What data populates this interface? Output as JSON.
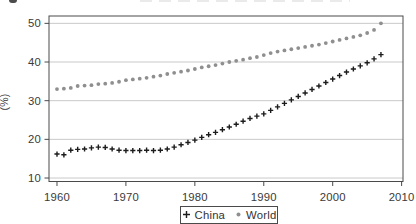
{
  "chart_data": {
    "type": "scatter",
    "title": "",
    "xlabel": "",
    "ylabel": "(%)",
    "x_ticks": [
      1960,
      1970,
      1980,
      1990,
      2000,
      2010
    ],
    "y_ticks": [
      10,
      20,
      30,
      40,
      50
    ],
    "xlim": [
      1958.84,
      2010.2
    ],
    "ylim": [
      9.1,
      51.9
    ],
    "grid": "horizontal-only",
    "gridline_color": "#c9c9c9",
    "frame_color": "#4a4a4a",
    "legend_position": "bottom-center",
    "x": [
      1960,
      1961,
      1962,
      1963,
      1964,
      1965,
      1966,
      1967,
      1968,
      1969,
      1970,
      1971,
      1972,
      1973,
      1974,
      1975,
      1976,
      1977,
      1978,
      1979,
      1980,
      1981,
      1982,
      1983,
      1984,
      1985,
      1986,
      1987,
      1988,
      1989,
      1990,
      1991,
      1992,
      1993,
      1994,
      1995,
      1996,
      1997,
      1998,
      1999,
      2000,
      2001,
      2002,
      2003,
      2004,
      2005,
      2006,
      2007
    ],
    "series": [
      {
        "name": "China",
        "marker": "plus",
        "color": "#1c1c1c",
        "values": [
          16.2,
          16.0,
          17.2,
          17.4,
          17.5,
          17.8,
          18.0,
          17.9,
          17.5,
          17.2,
          17.1,
          17.1,
          17.1,
          17.2,
          17.1,
          17.2,
          17.5,
          18.0,
          18.6,
          19.2,
          19.8,
          20.5,
          21.2,
          21.8,
          22.5,
          23.2,
          23.9,
          24.7,
          25.4,
          26.0,
          26.6,
          27.5,
          28.4,
          29.3,
          30.2,
          31.1,
          32.0,
          32.9,
          33.8,
          34.7,
          35.6,
          36.5,
          37.4,
          38.2,
          39.0,
          39.8,
          40.8,
          41.9
        ]
      },
      {
        "name": "World",
        "marker": "dot",
        "color": "#8f8f8f",
        "values": [
          33.0,
          33.1,
          33.3,
          33.8,
          33.9,
          34.0,
          34.3,
          34.4,
          34.6,
          34.9,
          35.3,
          35.5,
          35.7,
          35.9,
          36.2,
          36.5,
          36.9,
          37.2,
          37.5,
          37.8,
          38.2,
          38.6,
          38.9,
          39.2,
          39.6,
          40.0,
          40.3,
          40.6,
          41.0,
          41.3,
          41.8,
          42.3,
          42.7,
          43.0,
          43.3,
          43.6,
          43.9,
          44.2,
          44.5,
          44.9,
          45.3,
          45.7,
          46.1,
          46.5,
          46.9,
          47.5,
          48.3,
          50.0
        ]
      }
    ]
  },
  "legend": {
    "items": [
      {
        "label": "China",
        "marker": "plus"
      },
      {
        "label": "World",
        "marker": "dot"
      }
    ]
  }
}
